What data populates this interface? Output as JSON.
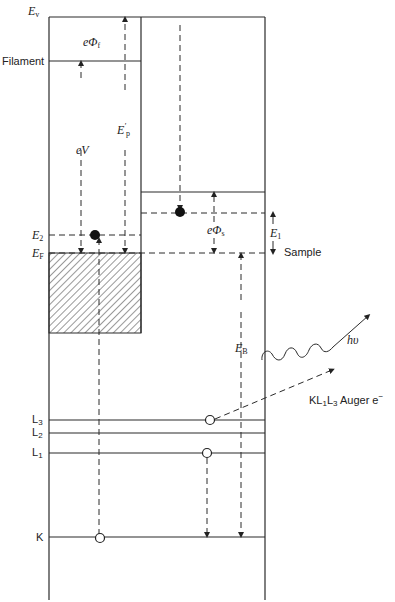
{
  "diagram": {
    "type": "energy-level diagram (Auger / appearance potential spectroscopy)",
    "colors": {
      "line": "#2a2a2a",
      "background": "#ffffff"
    },
    "left_labels": {
      "vacuum": "E",
      "vacuum_sub": "v",
      "filament": "Filament",
      "e2": "E",
      "e2_sub": "2",
      "ef": "E",
      "ef_sub": "F",
      "l3": "L",
      "l3_sub": "3",
      "l2": "L",
      "l2_sub": "2",
      "l1": "L",
      "l1_sub": "1",
      "k": "K"
    },
    "inner_labels": {
      "phi_f": "eΦ",
      "phi_f_sub": "f",
      "ev": "eV",
      "ep": "E",
      "ep_sub": "p",
      "ep_prime": "'",
      "phi_s": "eΦ",
      "phi_s_sub": "s",
      "eb": "E",
      "eb_sub": "B"
    },
    "right_labels": {
      "e1": "E",
      "e1_sub": "1",
      "sample": "Sample",
      "photon": "hυ",
      "auger_prefix": "KL",
      "auger_sub1": "1",
      "auger_mid": "L",
      "auger_sub2": "3",
      "auger_suffix": " Auger e",
      "auger_sup": "−"
    }
  }
}
